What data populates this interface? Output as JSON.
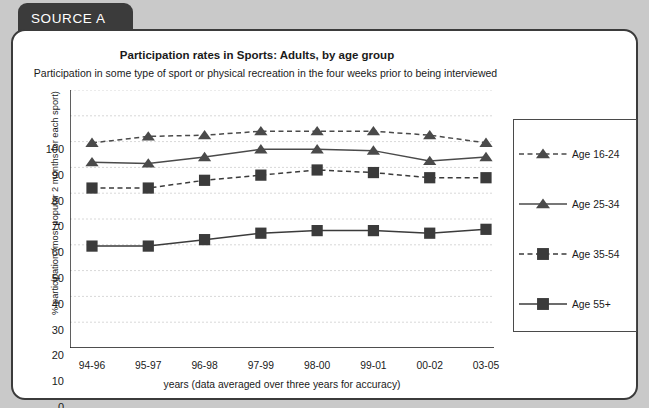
{
  "source_tab": {
    "label": "SOURCE A"
  },
  "chart_data": {
    "type": "line",
    "title": "Participation rates in Sports: Adults, by age group",
    "subtitle": "Participation in some type of sport or physical recreation in the four weeks prior to being interviewed",
    "xlabel": "years (data averaged over three years for accuracy)",
    "ylabel": "% participation (most popular 2 months for each sport)",
    "categories": [
      "94-96",
      "95-97",
      "96-98",
      "97-99",
      "98-00",
      "99-01",
      "00-02",
      "03-05"
    ],
    "ylim": [
      0,
      100
    ],
    "yticks": [
      0,
      10,
      20,
      30,
      40,
      50,
      60,
      70,
      80,
      90,
      100
    ],
    "grid": true,
    "legend_position": "right",
    "series": [
      {
        "name": "Age 16-24",
        "marker": "triangle",
        "line": "dashed",
        "color": "#4a4a4a",
        "values": [
          79.5,
          82,
          82.5,
          84,
          84,
          84,
          82.5,
          79.5
        ]
      },
      {
        "name": "Age 25-34",
        "marker": "triangle",
        "line": "solid",
        "color": "#4a4a4a",
        "values": [
          72,
          71.5,
          74,
          77,
          77,
          76.5,
          72.5,
          74
        ]
      },
      {
        "name": "Age 35-54",
        "marker": "square",
        "line": "dashed",
        "color": "#3b3b3b",
        "values": [
          62,
          62,
          65,
          67,
          69,
          68,
          66,
          66
        ]
      },
      {
        "name": "Age 55+",
        "marker": "square",
        "line": "solid",
        "color": "#3b3b3b",
        "values": [
          39.5,
          39.5,
          42,
          44.5,
          45.5,
          45.5,
          44.5,
          46
        ]
      }
    ]
  },
  "colors": {
    "background": "#c9c9c9",
    "panel": "#ffffff",
    "tab": "#3b3b3b",
    "ink": "#1a1a1a",
    "grid": "#d8d8d8",
    "series": "#4a4a4a"
  }
}
